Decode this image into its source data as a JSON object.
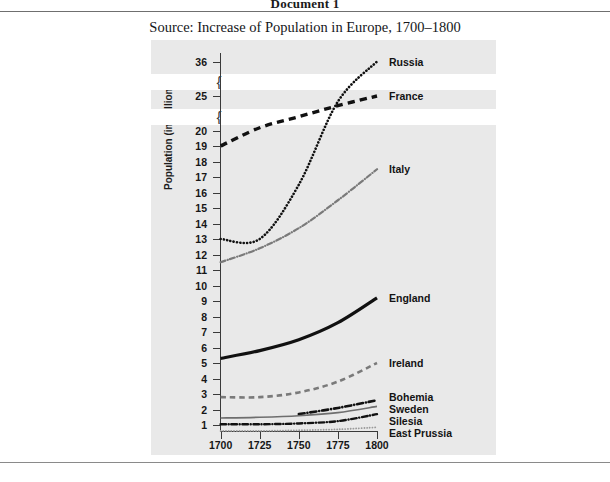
{
  "document": {
    "heading": "Document 1",
    "source_caption": "Source: Increase of Population in Europe, 1700–1800"
  },
  "chart_data": {
    "type": "line",
    "title": "Increase of Population in Europe, 1700–1800",
    "xlabel": "",
    "ylabel": "Population (in millions)",
    "x": [
      1700,
      1725,
      1750,
      1775,
      1800
    ],
    "xlim": [
      1700,
      1800
    ],
    "x_tick_labels": [
      "1700",
      "1725",
      "1750",
      "1775",
      "1800"
    ],
    "y_tick_labels": [
      "36",
      "25",
      "20",
      "19",
      "18",
      "17",
      "16",
      "15",
      "14",
      "13",
      "12",
      "11",
      "10",
      "9",
      "8",
      "7",
      "6",
      "5",
      "4",
      "3",
      "2",
      "1"
    ],
    "y_axis_broken": true,
    "y_axis_breaks": [
      "between 25 and 36",
      "between 20 and 25"
    ],
    "grid": false,
    "legend_position": "right-of-lines",
    "series": [
      {
        "name": "Russia",
        "label": "Russia",
        "style": "dotted",
        "color": "#111111",
        "width": 2.6,
        "values": [
          13.0,
          13.0,
          16.5,
          24.2,
          36.0
        ]
      },
      {
        "name": "France",
        "label": "France",
        "style": "dashed",
        "color": "#111111",
        "width": 3.4,
        "values": [
          19.0,
          20.4,
          22.0,
          23.6,
          25.0
        ]
      },
      {
        "name": "Italy",
        "label": "Italy",
        "style": "dash-dot",
        "color": "#7a7a7a",
        "width": 2.2,
        "values": [
          11.5,
          12.4,
          13.7,
          15.5,
          17.5
        ]
      },
      {
        "name": "England",
        "label": "England",
        "style": "solid",
        "color": "#111111",
        "width": 3.2,
        "values": [
          5.3,
          5.8,
          6.5,
          7.6,
          9.2
        ]
      },
      {
        "name": "Ireland",
        "label": "Ireland",
        "style": "dashed",
        "color": "#7a7a7a",
        "width": 2.6,
        "values": [
          2.8,
          2.8,
          3.1,
          3.8,
          5.0
        ]
      },
      {
        "name": "Bohemia",
        "label": "Bohemia",
        "style": "dash-dot",
        "color": "#111111",
        "width": 2.6,
        "values": [
          null,
          null,
          1.7,
          2.1,
          2.6
        ]
      },
      {
        "name": "Sweden",
        "label": "Sweden",
        "style": "solid",
        "color": "#6e6e6e",
        "width": 1.6,
        "values": [
          1.45,
          1.5,
          1.6,
          1.8,
          2.2
        ]
      },
      {
        "name": "Silesia",
        "label": "Silesia",
        "style": "dash-dot",
        "color": "#111111",
        "width": 2.4,
        "values": [
          1.05,
          1.05,
          1.1,
          1.25,
          1.7
        ]
      },
      {
        "name": "East Prussia",
        "label": "East Prussia",
        "style": "fine-dotted",
        "color": "#9a9a9a",
        "width": 1.8,
        "values": [
          0.62,
          0.62,
          0.66,
          0.72,
          0.85
        ]
      }
    ]
  },
  "colors": {
    "panel_background": "#e9e9e9",
    "axis": "#3a3a3a",
    "text": "#161616",
    "rule": "#6f6f6f"
  }
}
